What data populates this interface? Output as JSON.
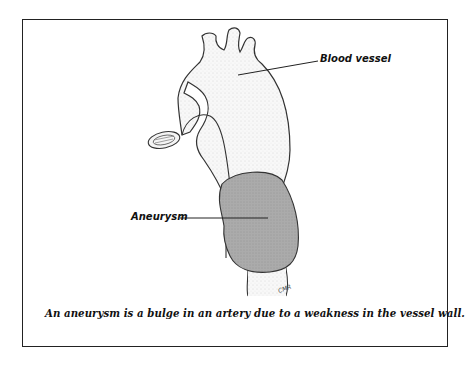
{
  "figure": {
    "labels": {
      "blood_vessel": "Blood vessel",
      "aneurysm": "Aneurysm"
    },
    "caption": "An aneurysm is a bulge in an artery due to a weakness in the vessel wall.",
    "signature": "CMR",
    "colors": {
      "aneurysm_fill": "#a9a9a9",
      "vessel_outline": "#333333",
      "vessel_fill": "#f6f6f6",
      "border": "#222222"
    }
  }
}
